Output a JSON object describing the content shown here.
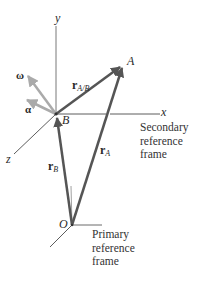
{
  "diagram": {
    "type": "relative-motion-kinematics",
    "points": {
      "A": {
        "label": "A",
        "x": 123,
        "y": 65
      },
      "B": {
        "label": "B",
        "x": 56,
        "y": 114
      },
      "O": {
        "label": "O",
        "x": 72,
        "y": 225
      }
    },
    "secondary_axes": {
      "x_label": "x",
      "y_label": "y",
      "z_label": "z"
    },
    "vectors": {
      "omega": {
        "symbol": "ω",
        "color": "#aaaaaa"
      },
      "alpha": {
        "symbol": "α",
        "color": "#aaaaaa"
      },
      "r_AB": {
        "symbol": "r",
        "subscript": "A/B",
        "color": "#555555"
      },
      "r_A": {
        "symbol": "r",
        "subscript": "A",
        "color": "#555555"
      },
      "r_B": {
        "symbol": "r",
        "subscript": "B",
        "color": "#555555"
      }
    },
    "captions": {
      "secondary": [
        "Secondary",
        "reference",
        "frame"
      ],
      "primary": [
        "Primary",
        "reference",
        "frame"
      ]
    },
    "colors": {
      "axis": "#333333",
      "position_vector": "#555555",
      "angular_vector": "#aaaaaa",
      "background": "#ffffff"
    }
  }
}
